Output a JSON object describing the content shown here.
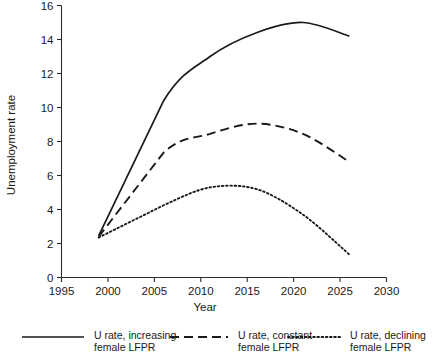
{
  "chart_data": {
    "type": "line",
    "title": "",
    "xlabel": "Year",
    "ylabel": "Unemployment rate",
    "xlim": [
      1995,
      2030
    ],
    "ylim": [
      0,
      16
    ],
    "xticks": [
      1995,
      2000,
      2005,
      2010,
      2015,
      2020,
      2025,
      2030
    ],
    "yticks": [
      0,
      2,
      4,
      6,
      8,
      10,
      12,
      14,
      16
    ],
    "grid": false,
    "legend_position": "bottom",
    "series": [
      {
        "name": "U rate, increasing female LFPR",
        "style": "solid",
        "x": [
          1999,
          2006,
          2011,
          2016,
          2021,
          2026
        ],
        "values": [
          2.45,
          10.4,
          13.0,
          14.4,
          15.0,
          14.2
        ]
      },
      {
        "name": "U rate, constant female LFPR",
        "style": "dashed",
        "x": [
          1999,
          2006,
          2011,
          2016,
          2021,
          2026
        ],
        "values": [
          2.4,
          7.35,
          8.45,
          9.05,
          8.45,
          6.8
        ]
      },
      {
        "name": "U rate, declining female LFPR",
        "style": "dotted",
        "x": [
          1999,
          2006,
          2011,
          2016,
          2021,
          2026
        ],
        "values": [
          2.35,
          4.25,
          5.3,
          5.2,
          3.7,
          1.35
        ]
      }
    ]
  },
  "legend": {
    "entries": [
      {
        "line1": "U rate, increasing",
        "line2": "female LFPR",
        "style": "solid"
      },
      {
        "line1": "U rate, constant",
        "line2": "female LFPR",
        "style": "dashed"
      },
      {
        "line1": "U rate, declining",
        "line2": "female LFPR",
        "style": "dotted"
      }
    ]
  },
  "colors": {
    "ink": "#1a1a1a",
    "axis": "#2b2b2b",
    "background": "#ffffff"
  }
}
